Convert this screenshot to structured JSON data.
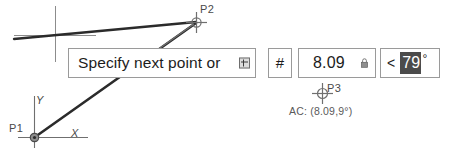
{
  "app": {
    "context": "cad-dynamic-input-overlay"
  },
  "prompt": {
    "text": "Specify next point or",
    "expand_icon": "expand-options-icon"
  },
  "fields": {
    "mode": {
      "label": "#",
      "icon_name": "relative-coordinate-hash-icon"
    },
    "distance": {
      "value": "8.09",
      "lock_icon": "lock-icon",
      "locked": true
    },
    "angle": {
      "prefix": "<",
      "value": "79",
      "unit": "°",
      "selected": true,
      "selection_color": "#4b4b4b"
    }
  },
  "points": {
    "p1": {
      "label": "P1"
    },
    "p2": {
      "label": "P2"
    },
    "p3": {
      "label": "P3"
    }
  },
  "ucs": {
    "x_label": "X",
    "y_label": "Y"
  },
  "readout": {
    "text": "AC: (8.09,9°)"
  },
  "colors": {
    "geometry": "#2b2b2b",
    "marker": "#6f6f6f",
    "box_border": "#9a9a9a",
    "text": "#1c1c1c",
    "muted_text": "#5a5a5a",
    "highlight": "#4b4b4b"
  }
}
